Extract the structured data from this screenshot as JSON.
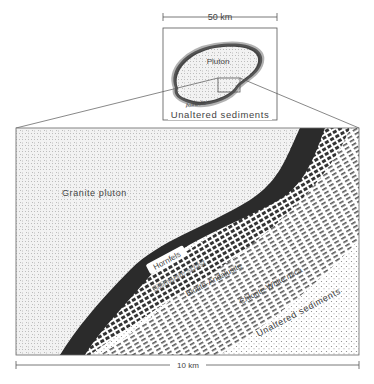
{
  "inset": {
    "scale_label": "50 km",
    "pluton_label": "Pluton",
    "aureole_label": "Aureole",
    "sediments_label": "Unaltered sediments"
  },
  "main": {
    "granite_label": "Granite pluton",
    "zones": [
      {
        "label": "Hornfels"
      },
      {
        "label": "Sillimanite schist"
      },
      {
        "label": "Biotite-Andalusite"
      },
      {
        "label": "Chlorite-White mica"
      }
    ],
    "sediments_label": "Unaltered sediments",
    "scale_label": "10 km"
  },
  "colors": {
    "hornfels": "#2b2b2b",
    "granite_stipple": "#9a9a9a",
    "frame": "#555555"
  }
}
